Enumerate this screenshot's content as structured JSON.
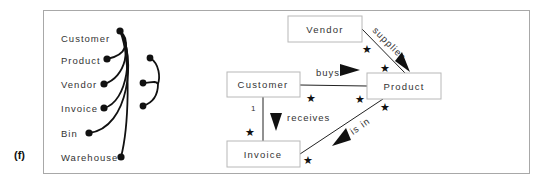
{
  "figure": {
    "panel_label": "(f)"
  },
  "left_diagram": {
    "items": [
      {
        "label": "Customer"
      },
      {
        "label": "Product"
      },
      {
        "label": "Vendor"
      },
      {
        "label": "Invoice"
      },
      {
        "label": "Bin"
      },
      {
        "label": "Warehouse"
      }
    ]
  },
  "right_diagram": {
    "classes": [
      {
        "name": "Vendor"
      },
      {
        "name": "Customer"
      },
      {
        "name": "Product"
      },
      {
        "name": "Invoice"
      }
    ],
    "associations": [
      {
        "label": "supplies",
        "from": "Vendor",
        "to": "Product",
        "from_mult": "*",
        "to_mult": "*"
      },
      {
        "label": "buys",
        "from": "Customer",
        "to": "Product",
        "from_mult": "*",
        "to_mult": "*"
      },
      {
        "label": "receives",
        "from": "Customer",
        "to": "Invoice",
        "from_mult": "1",
        "to_mult": "*"
      },
      {
        "label": "is in",
        "from": "Product",
        "to": "Invoice",
        "from_mult": "*",
        "to_mult": "*"
      }
    ],
    "star_symbol": "★"
  },
  "colors": {
    "ink": "#111111",
    "box_border": "#b8b8b8",
    "frame_border": "#a8a8a8"
  }
}
